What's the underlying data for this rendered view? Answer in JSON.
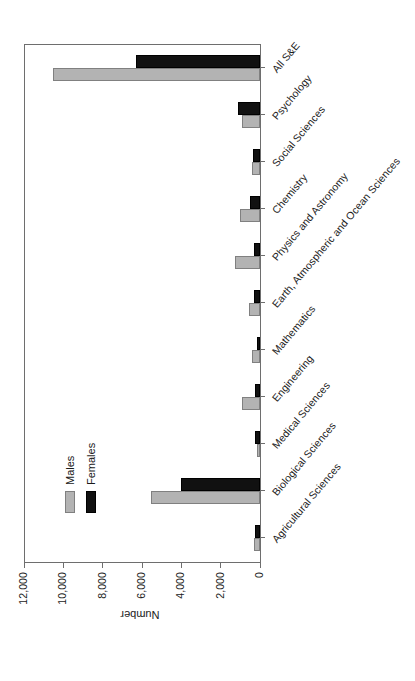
{
  "chart_data": {
    "type": "bar",
    "orientation": "vertical",
    "title": "",
    "xlabel": "",
    "ylabel": "Number",
    "ylim": [
      0,
      12000
    ],
    "grid": false,
    "legend_position": "upper-left-inside",
    "y_ticks": [
      "0",
      "2,000",
      "4,000",
      "6,000",
      "8,000",
      "10,000",
      "12,000"
    ],
    "y_tick_values": [
      0,
      2000,
      4000,
      6000,
      8000,
      10000,
      12000
    ],
    "categories": [
      "Agricultural Sciences",
      "Biological Sciences",
      "Medical Sciences",
      "Engineering",
      "Mathematics",
      "Earth, Atmospheric and Ocean  Sciences",
      "Physics and Astronomy",
      "Chemistry",
      "Social Sciences",
      "Psychology",
      "All S&E"
    ],
    "series": [
      {
        "name": "Males",
        "color": "#b3b3b3",
        "values": [
          305,
          5520,
          170,
          895,
          420,
          560,
          1270,
          995,
          420,
          895,
          10525
        ]
      },
      {
        "name": "Females",
        "color": "#111111",
        "values": [
          255,
          3995,
          270,
          255,
          170,
          305,
          285,
          510,
          335,
          1100,
          6305
        ]
      }
    ]
  },
  "legend": {
    "items": [
      {
        "label": "Males",
        "color": "#b3b3b3"
      },
      {
        "label": "Females",
        "color": "#111111"
      }
    ]
  },
  "axes": {
    "value_axis_title": "Number"
  }
}
